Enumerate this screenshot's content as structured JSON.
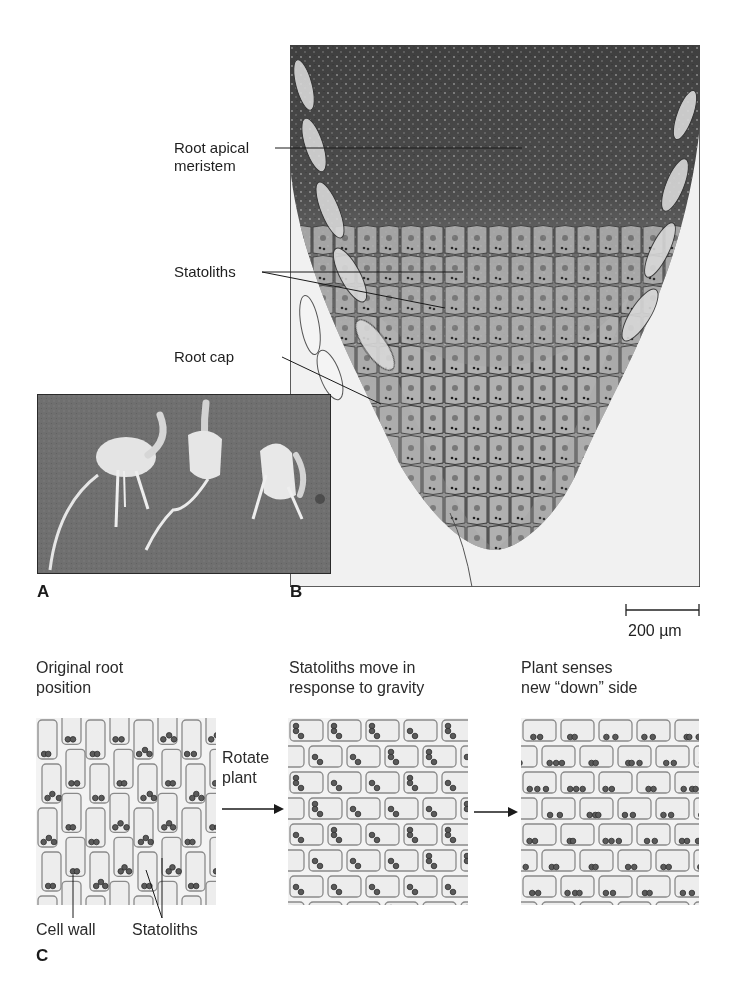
{
  "figure": {
    "panel_b": {
      "letter": "B",
      "labels": {
        "meristem_line1": "Root apical",
        "meristem_line2": "meristem",
        "statoliths": "Statoliths",
        "root_cap": "Root cap"
      },
      "scale_bar": {
        "label": "200 µm",
        "value_um": 200
      }
    },
    "panel_a": {
      "letter": "A",
      "subject": "three germinating seedlings with curved roots",
      "seedling_count": 3
    },
    "panel_c": {
      "letter": "C",
      "stage1": {
        "line1": "Original root",
        "line2": "position"
      },
      "arrow1": {
        "line1": "Rotate",
        "line2": "plant"
      },
      "stage2": {
        "line1": "Statoliths move in",
        "line2": "response to gravity"
      },
      "stage3": {
        "line1": "Plant senses",
        "line2": "new “down” side"
      },
      "callouts": {
        "cell_wall": "Cell wall",
        "statoliths": "Statoliths"
      }
    },
    "colors": {
      "cell_fill": "#ededed",
      "cell_wall": "#8a8a8a",
      "statolith": "#5a5a5a",
      "photo_bg": "#6e6e6e",
      "micrograph_dark": "#4a4a4a"
    }
  }
}
